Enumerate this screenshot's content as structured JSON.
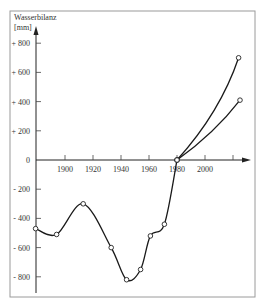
{
  "chart_data": {
    "type": "line",
    "title": "",
    "ylabel": "Wasserbilanz",
    "yunit": "[mm]",
    "xlabel": "",
    "xlim": [
      1879,
      2030
    ],
    "ylim": [
      -900,
      900
    ],
    "grid": false,
    "legend": "none",
    "x_ticks": [
      {
        "value": 1900,
        "label": "1900"
      },
      {
        "value": 1920,
        "label": "1920"
      },
      {
        "value": 1940,
        "label": "1940"
      },
      {
        "value": 1960,
        "label": "1960"
      },
      {
        "value": 1980,
        "label": "1980"
      },
      {
        "value": 2000,
        "label": "2000"
      },
      {
        "value": 2020,
        "label": ""
      }
    ],
    "y_ticks": [
      {
        "value": 800,
        "label": "+ 800"
      },
      {
        "value": 600,
        "label": "+ 600"
      },
      {
        "value": 400,
        "label": "+ 400"
      },
      {
        "value": 200,
        "label": "+ 200"
      },
      {
        "value": 0,
        "label": "0"
      },
      {
        "value": -200,
        "label": "- 200"
      },
      {
        "value": -400,
        "label": "- 400"
      },
      {
        "value": -600,
        "label": "- 600"
      },
      {
        "value": -800,
        "label": "- 800"
      }
    ],
    "series": [
      {
        "name": "historical",
        "smooth": true,
        "points": [
          {
            "x": 1879,
            "y": -470
          },
          {
            "x": 1894,
            "y": -510
          },
          {
            "x": 1913,
            "y": -300
          },
          {
            "x": 1933,
            "y": -600
          },
          {
            "x": 1944,
            "y": -820
          },
          {
            "x": 1954,
            "y": -750
          },
          {
            "x": 1961,
            "y": -520
          },
          {
            "x": 1971,
            "y": -440
          },
          {
            "x": 1980,
            "y": 0
          }
        ]
      },
      {
        "name": "projection-high",
        "smooth": true,
        "points": [
          {
            "x": 1980,
            "y": 0
          },
          {
            "x": 2024,
            "y": 700
          }
        ]
      },
      {
        "name": "projection-low",
        "smooth": true,
        "points": [
          {
            "x": 1980,
            "y": 0
          },
          {
            "x": 2025,
            "y": 410
          }
        ]
      }
    ]
  }
}
